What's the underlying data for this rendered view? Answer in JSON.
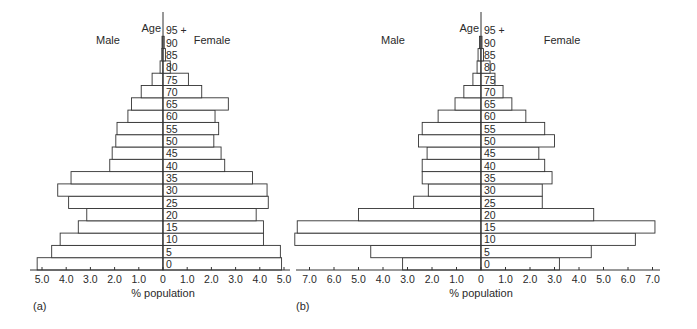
{
  "chart_data": [
    {
      "type": "bar",
      "subtype": "population-pyramid",
      "panel_label": "(a)",
      "title": "",
      "xlabel": "% population",
      "ylabel": "Age",
      "left_label": "Male",
      "right_label": "Female",
      "age_groups": [
        "0",
        "5",
        "10",
        "15",
        "20",
        "25",
        "30",
        "35",
        "40",
        "45",
        "50",
        "55",
        "60",
        "65",
        "70",
        "75",
        "80",
        "85",
        "90",
        "95 +"
      ],
      "series": [
        {
          "name": "Male",
          "values": [
            5.2,
            4.6,
            4.25,
            3.5,
            3.15,
            3.9,
            4.35,
            3.8,
            2.2,
            2.1,
            1.95,
            1.9,
            1.45,
            1.3,
            0.9,
            0.45,
            0.12,
            0.05,
            0.04,
            0.0
          ]
        },
        {
          "name": "Female",
          "values": [
            4.9,
            4.85,
            4.15,
            4.15,
            3.85,
            4.35,
            4.3,
            3.7,
            2.55,
            2.4,
            2.1,
            2.3,
            2.15,
            2.7,
            1.6,
            1.05,
            0.3,
            0.1,
            0.05,
            0.0
          ]
        }
      ],
      "x_ticks_left": [
        "5.0",
        "4.0",
        "3.0",
        "2.0",
        "1.0"
      ],
      "x_ticks_right": [
        "0",
        "1.0",
        "2.0",
        "3.0",
        "4.0",
        "5.0"
      ],
      "xlim": [
        -5.0,
        5.0
      ],
      "grid": false,
      "legend": "none"
    },
    {
      "type": "bar",
      "subtype": "population-pyramid",
      "panel_label": "(b)",
      "title": "",
      "xlabel": "% population",
      "ylabel": "Age",
      "left_label": "Male",
      "right_label": "Female",
      "age_groups": [
        "0",
        "5",
        "10",
        "15",
        "20",
        "25",
        "30",
        "35",
        "40",
        "45",
        "50",
        "55",
        "60",
        "65",
        "70",
        "75",
        "80",
        "85",
        "90",
        "95 +"
      ],
      "series": [
        {
          "name": "Male",
          "values": [
            3.2,
            4.5,
            7.6,
            7.5,
            5.0,
            2.75,
            2.15,
            2.4,
            2.4,
            2.2,
            2.55,
            2.4,
            1.75,
            1.06,
            0.7,
            0.33,
            0.16,
            0.12,
            0.06,
            0.0
          ]
        },
        {
          "name": "Female",
          "values": [
            3.2,
            4.5,
            6.3,
            7.1,
            4.6,
            2.5,
            2.5,
            2.9,
            2.6,
            2.36,
            3.0,
            2.6,
            1.83,
            1.26,
            0.9,
            0.57,
            0.37,
            0.1,
            0.04,
            0.0
          ]
        }
      ],
      "x_ticks_left": [
        "7.0",
        "6.0",
        "5.0",
        "4.0",
        "3.0",
        "2.0",
        "1.0"
      ],
      "x_ticks_right": [
        "0",
        "1.0",
        "2.0",
        "3.0",
        "4.0",
        "5.0",
        "6.0",
        "7.0"
      ],
      "xlim": [
        -7.0,
        7.0
      ],
      "grid": false,
      "legend": "none"
    }
  ],
  "layout": [
    {
      "cx": 163,
      "scale": 24.2,
      "axis_x0": 30,
      "axis_x1": 290,
      "male_label_x": 108,
      "female_label_x": 212,
      "panel_label_x": 33
    },
    {
      "cx": 481,
      "scale": 24.5,
      "axis_x0": 296,
      "axis_x1": 660,
      "male_label_x": 393,
      "female_label_x": 562,
      "panel_label_x": 296
    }
  ]
}
